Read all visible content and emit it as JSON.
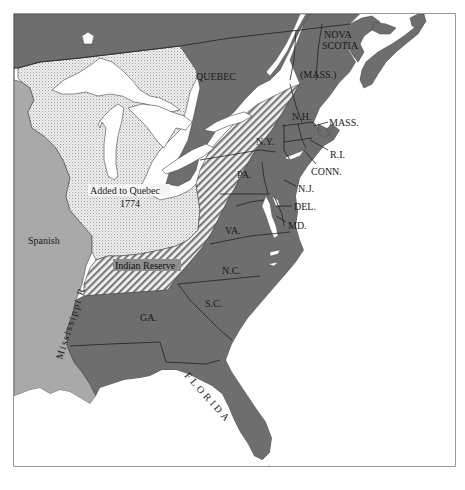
{
  "map": {
    "title": "",
    "colors": {
      "colonies": "#6e6e6e",
      "spanish": "#a9a9a9",
      "added_to_quebec": "#e6e6e6",
      "indian_reserve_hatch": "#8a8a8a",
      "water": "#ffffff",
      "border": "#555555"
    },
    "regions": {
      "quebec": "QUEBEC",
      "nova_scotia_line1": "NOVA",
      "nova_scotia_line2": "SCOTIA",
      "mass_maine": "(MASS.)",
      "nh": "N.H.",
      "mass": "MASS.",
      "ri": "R.I.",
      "conn": "CONN.",
      "ny": "N.Y.",
      "pa": "PA.",
      "nj": "N.J.",
      "del": "DEL.",
      "md": "MD.",
      "va": "VA.",
      "nc": "N.C.",
      "sc": "S.C.",
      "ga": "GA.",
      "florida": "FLORIDA",
      "spanish": "Spanish",
      "added_line1": "Added to Quebec",
      "added_line2": "1774",
      "indian_reserve": "Indian Reserve",
      "mississippi": "Mississippi R."
    }
  }
}
